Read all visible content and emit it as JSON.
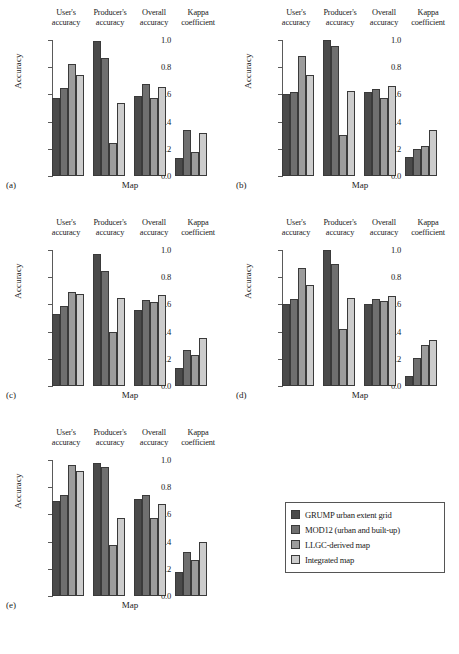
{
  "figure": {
    "xlabel": "Map",
    "ylabel": "Accuracy",
    "ytick_labels": [
      "1.0",
      "0.8",
      "0.6",
      "0.4",
      "0.2",
      "0.0"
    ],
    "group_headers": [
      "User's\naccuracy",
      "Producer's\naccuracy",
      "Overall\naccuracy",
      "Kappa\ncoefficient"
    ],
    "panel_tags": [
      "(a)",
      "(b)",
      "(c)",
      "(d)",
      "(e)"
    ]
  },
  "legend": {
    "items": [
      {
        "label": "GRUMP urban extent grid",
        "color": "#4a4a4a"
      },
      {
        "label": "MOD12 (urban and built-up)",
        "color": "#6f6f6f"
      },
      {
        "label": "LLGC-derived map",
        "color": "#9c9c9c"
      },
      {
        "label": "Integrated map",
        "color": "#cccccc"
      }
    ]
  },
  "chart_data": [
    {
      "type": "bar",
      "panel": "(a)",
      "title": "",
      "xlabel": "Map",
      "ylabel": "Accuracy",
      "ylim": [
        0,
        1.0
      ],
      "yticks": [
        0.0,
        0.2,
        0.4,
        0.6,
        0.8,
        1.0
      ],
      "grid": false,
      "legend_position": "outside-bottom-right",
      "categories": [
        "User's accuracy",
        "Producer's accuracy",
        "Overall accuracy",
        "Kappa coefficient"
      ],
      "series": [
        {
          "name": "GRUMP urban extent grid",
          "values": [
            0.57,
            0.99,
            0.59,
            0.13
          ]
        },
        {
          "name": "MOD12 (urban and built-up)",
          "values": [
            0.65,
            0.87,
            0.68,
            0.34
          ]
        },
        {
          "name": "LLGC-derived map",
          "values": [
            0.82,
            0.245,
            0.57,
            0.175
          ]
        },
        {
          "name": "Integrated map",
          "values": [
            0.745,
            0.535,
            0.655,
            0.315
          ]
        }
      ]
    },
    {
      "type": "bar",
      "panel": "(b)",
      "title": "",
      "xlabel": "Map",
      "ylabel": "Accuracy",
      "ylim": [
        0,
        1.0
      ],
      "yticks": [
        0.0,
        0.2,
        0.4,
        0.6,
        0.8,
        1.0
      ],
      "grid": false,
      "legend_position": "outside-bottom-right",
      "categories": [
        "User's accuracy",
        "Producer's accuracy",
        "Overall accuracy",
        "Kappa coefficient"
      ],
      "series": [
        {
          "name": "GRUMP urban extent grid",
          "values": [
            0.6,
            1.0,
            0.62,
            0.14
          ]
        },
        {
          "name": "MOD12 (urban and built-up)",
          "values": [
            0.615,
            0.955,
            0.64,
            0.2
          ]
        },
        {
          "name": "LLGC-derived map",
          "values": [
            0.885,
            0.3,
            0.575,
            0.22
          ]
        },
        {
          "name": "Integrated map",
          "values": [
            0.745,
            0.625,
            0.665,
            0.34
          ]
        }
      ]
    },
    {
      "type": "bar",
      "panel": "(c)",
      "title": "",
      "xlabel": "Map",
      "ylabel": "Accuracy",
      "ylim": [
        0,
        1.0
      ],
      "yticks": [
        0.0,
        0.2,
        0.4,
        0.6,
        0.8,
        1.0
      ],
      "grid": false,
      "legend_position": "outside-bottom-right",
      "categories": [
        "User's accuracy",
        "Producer's accuracy",
        "Overall accuracy",
        "Kappa coefficient"
      ],
      "series": [
        {
          "name": "GRUMP urban extent grid",
          "values": [
            0.53,
            0.97,
            0.56,
            0.13
          ]
        },
        {
          "name": "MOD12 (urban and built-up)",
          "values": [
            0.59,
            0.845,
            0.63,
            0.265
          ]
        },
        {
          "name": "LLGC-derived map",
          "values": [
            0.69,
            0.4,
            0.615,
            0.225
          ]
        },
        {
          "name": "Integrated map",
          "values": [
            0.675,
            0.65,
            0.67,
            0.35
          ]
        }
      ]
    },
    {
      "type": "bar",
      "panel": "(d)",
      "title": "",
      "xlabel": "Map",
      "ylabel": "Accuracy",
      "ylim": [
        0,
        1.0
      ],
      "yticks": [
        0.0,
        0.2,
        0.4,
        0.6,
        0.8,
        1.0
      ],
      "grid": false,
      "legend_position": "outside-bottom-right",
      "categories": [
        "User's accuracy",
        "Producer's accuracy",
        "Overall accuracy",
        "Kappa coefficient"
      ],
      "series": [
        {
          "name": "GRUMP urban extent grid",
          "values": [
            0.6,
            1.0,
            0.605,
            0.07
          ]
        },
        {
          "name": "MOD12 (urban and built-up)",
          "values": [
            0.64,
            0.9,
            0.64,
            0.205
          ]
        },
        {
          "name": "LLGC-derived map",
          "values": [
            0.865,
            0.42,
            0.625,
            0.3
          ]
        },
        {
          "name": "Integrated map",
          "values": [
            0.745,
            0.65,
            0.665,
            0.335
          ]
        }
      ]
    },
    {
      "type": "bar",
      "panel": "(e)",
      "title": "",
      "xlabel": "Map",
      "ylabel": "Accuracy",
      "ylim": [
        0,
        1.0
      ],
      "yticks": [
        0.0,
        0.2,
        0.4,
        0.6,
        0.8,
        1.0
      ],
      "grid": false,
      "legend_position": "outside-bottom-right",
      "categories": [
        "User's accuracy",
        "Producer's accuracy",
        "Overall accuracy",
        "Kappa coefficient"
      ],
      "series": [
        {
          "name": "GRUMP urban extent grid",
          "values": [
            0.7,
            0.98,
            0.71,
            0.18
          ]
        },
        {
          "name": "MOD12 (urban and built-up)",
          "values": [
            0.74,
            0.945,
            0.74,
            0.32
          ]
        },
        {
          "name": "LLGC-derived map",
          "values": [
            0.96,
            0.375,
            0.57,
            0.265
          ]
        },
        {
          "name": "Integrated map",
          "values": [
            0.92,
            0.57,
            0.68,
            0.395
          ]
        }
      ]
    }
  ]
}
